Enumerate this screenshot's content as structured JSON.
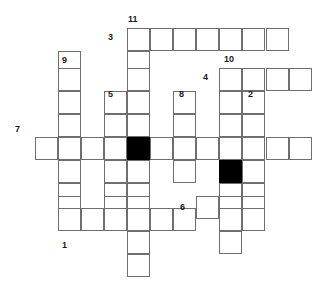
{
  "puzzle": {
    "type": "crossword-grid",
    "title": "Crossword puzzle grid",
    "cell_size": 23,
    "origin": {
      "x": 35,
      "y": 28
    },
    "colors": {
      "cell_background": "#ffffff",
      "cell_border": "#6f6f6f",
      "blocked_cell": "#000000",
      "label_text": "#1a1a1a",
      "page_background": "#ffffff"
    },
    "columns_px": [
      35,
      58,
      81,
      104,
      127,
      150,
      173,
      196,
      219,
      242,
      266,
      289
    ],
    "rows_px": [
      28,
      51,
      68,
      91,
      114,
      137,
      160,
      183,
      196,
      208,
      231,
      254,
      277
    ],
    "entries": [
      {
        "number": "1",
        "direction": "across",
        "length": 5,
        "start": {
          "col": 2,
          "row": 9
        }
      },
      {
        "number": "2",
        "direction": "down",
        "length": 6,
        "start": {
          "col": 9,
          "row": 3
        }
      },
      {
        "number": "3",
        "direction": "across",
        "length": 7,
        "start": {
          "col": 4,
          "row": 0
        }
      },
      {
        "number": "4",
        "direction": "across",
        "length": 4,
        "start": {
          "col": 8,
          "row": 2
        }
      },
      {
        "number": "5",
        "direction": "down",
        "length": 6,
        "start": {
          "col": 3,
          "row": 3
        }
      },
      {
        "number": "6",
        "direction": "across",
        "length": 3,
        "start": {
          "col": 7,
          "row": 8
        }
      },
      {
        "number": "7",
        "direction": "across",
        "length": 12,
        "start": {
          "col": 0,
          "row": 5
        }
      },
      {
        "number": "8",
        "direction": "down",
        "length": 3,
        "start": {
          "col": 6,
          "row": 3
        }
      },
      {
        "number": "9",
        "direction": "down",
        "length": 8,
        "start": {
          "col": 1,
          "row": 1
        }
      },
      {
        "number": "10",
        "direction": "down",
        "length": 9,
        "start": {
          "col": 8,
          "row": 2
        }
      },
      {
        "number": "11",
        "direction": "down",
        "length": 12,
        "start": {
          "col": 4,
          "row": 0
        }
      }
    ],
    "labels": [
      {
        "text": "11",
        "x": 128,
        "y": 14,
        "name": "clue-number-11"
      },
      {
        "text": "3",
        "x": 108,
        "y": 32,
        "name": "clue-number-3"
      },
      {
        "text": "9",
        "x": 62,
        "y": 55,
        "name": "clue-number-9"
      },
      {
        "text": "10",
        "x": 224,
        "y": 54,
        "name": "clue-number-10"
      },
      {
        "text": "4",
        "x": 203,
        "y": 72,
        "name": "clue-number-4"
      },
      {
        "text": "5",
        "x": 108,
        "y": 89,
        "name": "clue-number-5"
      },
      {
        "text": "8",
        "x": 179,
        "y": 89,
        "name": "clue-number-8"
      },
      {
        "text": "2",
        "x": 248,
        "y": 89,
        "name": "clue-number-2"
      },
      {
        "text": "7",
        "x": 15,
        "y": 124,
        "name": "clue-number-7"
      },
      {
        "text": "6",
        "x": 180,
        "y": 202,
        "name": "clue-number-6"
      },
      {
        "text": "1",
        "x": 62,
        "y": 240,
        "name": "clue-number-1"
      }
    ],
    "cells": [
      {
        "col": 4,
        "row": 0,
        "blocked": false
      },
      {
        "col": 5,
        "row": 0,
        "blocked": false
      },
      {
        "col": 6,
        "row": 0,
        "blocked": false
      },
      {
        "col": 7,
        "row": 0,
        "blocked": false
      },
      {
        "col": 8,
        "row": 0,
        "blocked": false
      },
      {
        "col": 9,
        "row": 0,
        "blocked": false
      },
      {
        "col": 10,
        "row": 0,
        "blocked": false
      },
      {
        "col": 1,
        "row": 1,
        "blocked": false
      },
      {
        "col": 4,
        "row": 1,
        "blocked": false
      },
      {
        "col": 1,
        "row": 2,
        "blocked": false
      },
      {
        "col": 4,
        "row": 2,
        "blocked": false
      },
      {
        "col": 8,
        "row": 2,
        "blocked": false
      },
      {
        "col": 9,
        "row": 2,
        "blocked": false
      },
      {
        "col": 10,
        "row": 2,
        "blocked": false
      },
      {
        "col": 11,
        "row": 2,
        "blocked": false
      },
      {
        "col": 1,
        "row": 3,
        "blocked": false
      },
      {
        "col": 3,
        "row": 3,
        "blocked": false
      },
      {
        "col": 4,
        "row": 3,
        "blocked": false
      },
      {
        "col": 6,
        "row": 3,
        "blocked": false
      },
      {
        "col": 8,
        "row": 3,
        "blocked": false
      },
      {
        "col": 9,
        "row": 3,
        "blocked": false
      },
      {
        "col": 1,
        "row": 4,
        "blocked": false
      },
      {
        "col": 3,
        "row": 4,
        "blocked": false
      },
      {
        "col": 4,
        "row": 4,
        "blocked": false
      },
      {
        "col": 6,
        "row": 4,
        "blocked": false
      },
      {
        "col": 8,
        "row": 4,
        "blocked": false
      },
      {
        "col": 9,
        "row": 4,
        "blocked": false
      },
      {
        "col": 0,
        "row": 5,
        "blocked": false
      },
      {
        "col": 1,
        "row": 5,
        "blocked": false
      },
      {
        "col": 2,
        "row": 5,
        "blocked": false
      },
      {
        "col": 3,
        "row": 5,
        "blocked": false
      },
      {
        "col": 4,
        "row": 5,
        "blocked": true
      },
      {
        "col": 5,
        "row": 5,
        "blocked": false
      },
      {
        "col": 6,
        "row": 5,
        "blocked": false
      },
      {
        "col": 7,
        "row": 5,
        "blocked": false
      },
      {
        "col": 8,
        "row": 5,
        "blocked": false
      },
      {
        "col": 9,
        "row": 5,
        "blocked": false
      },
      {
        "col": 10,
        "row": 5,
        "blocked": false
      },
      {
        "col": 11,
        "row": 5,
        "blocked": false
      },
      {
        "col": 1,
        "row": 6,
        "blocked": false
      },
      {
        "col": 3,
        "row": 6,
        "blocked": false
      },
      {
        "col": 4,
        "row": 6,
        "blocked": false
      },
      {
        "col": 6,
        "row": 6,
        "blocked": false
      },
      {
        "col": 8,
        "row": 6,
        "blocked": true
      },
      {
        "col": 9,
        "row": 6,
        "blocked": false
      },
      {
        "col": 1,
        "row": 7,
        "blocked": false
      },
      {
        "col": 3,
        "row": 7,
        "blocked": false
      },
      {
        "col": 4,
        "row": 7,
        "blocked": false
      },
      {
        "col": 8,
        "row": 7,
        "blocked": false
      },
      {
        "col": 9,
        "row": 7,
        "blocked": false
      },
      {
        "col": 1,
        "row": 8,
        "blocked": false
      },
      {
        "col": 3,
        "row": 8,
        "blocked": false
      },
      {
        "col": 4,
        "row": 8,
        "blocked": false
      },
      {
        "col": 7,
        "row": 8,
        "blocked": false
      },
      {
        "col": 8,
        "row": 8,
        "blocked": false
      },
      {
        "col": 9,
        "row": 8,
        "blocked": false
      },
      {
        "col": 1,
        "row": 9,
        "blocked": false
      },
      {
        "col": 2,
        "row": 9,
        "blocked": false
      },
      {
        "col": 3,
        "row": 9,
        "blocked": false
      },
      {
        "col": 4,
        "row": 9,
        "blocked": false
      },
      {
        "col": 5,
        "row": 9,
        "blocked": false
      },
      {
        "col": 6,
        "row": 9,
        "blocked": false
      },
      {
        "col": 8,
        "row": 9,
        "blocked": false
      },
      {
        "col": 9,
        "row": 9,
        "blocked": false
      },
      {
        "col": 4,
        "row": 10,
        "blocked": false
      },
      {
        "col": 8,
        "row": 10,
        "blocked": false
      },
      {
        "col": 4,
        "row": 11,
        "blocked": false
      }
    ]
  }
}
